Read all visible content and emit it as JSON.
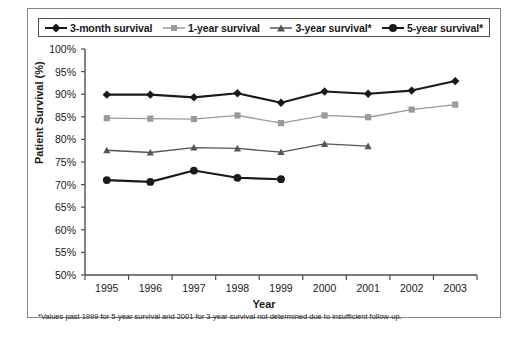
{
  "chart_data": {
    "type": "line",
    "title": "",
    "xlabel": "Year",
    "ylabel": "Patient Survival (%)",
    "categories": [
      1995,
      1996,
      1997,
      1998,
      1999,
      2000,
      2001,
      2002,
      2003
    ],
    "x_tick_labels": [
      "1995",
      "1996",
      "1997",
      "1998",
      "1999",
      "2000",
      "2001",
      "2002",
      "2003"
    ],
    "y_tick_labels": [
      "100%",
      "95%",
      "90%",
      "85%",
      "80%",
      "75%",
      "70%",
      "65%",
      "60%",
      "55%",
      "50%"
    ],
    "y_tick_values": [
      100,
      95,
      90,
      85,
      80,
      75,
      70,
      65,
      60,
      55,
      50
    ],
    "ylim": [
      50,
      100
    ],
    "y_tick_step": 5,
    "grid": false,
    "legend_position": "top",
    "series": [
      {
        "name": "3-month survival",
        "marker": "diamond",
        "color": "#1a1a1a",
        "values": [
          89.9,
          89.9,
          89.3,
          90.2,
          88.1,
          90.6,
          90.1,
          90.8,
          92.9
        ]
      },
      {
        "name": "1-year survival",
        "marker": "square",
        "color": "#9a9a9a",
        "values": [
          84.7,
          84.6,
          84.5,
          85.3,
          83.6,
          85.3,
          84.9,
          86.6,
          87.7
        ]
      },
      {
        "name": "3-year survival*",
        "marker": "triangle",
        "color": "#555555",
        "values": [
          77.6,
          77.1,
          78.2,
          78.0,
          77.2,
          79.0,
          78.5,
          null,
          null
        ]
      },
      {
        "name": "5-year survival*",
        "marker": "circle",
        "color": "#1a1a1a",
        "values": [
          71.0,
          70.6,
          73.1,
          71.5,
          71.2,
          null,
          null,
          null,
          null
        ]
      }
    ],
    "footnote": "*Values past 1999 for 5-year survival and 2001 for 3-year survival not determined due to insufficient follow-up."
  },
  "legend": {
    "items": [
      {
        "label": "3-month survival",
        "marker": "diamond",
        "color": "#1a1a1a"
      },
      {
        "label": "1-year survival",
        "marker": "square",
        "color": "#9a9a9a"
      },
      {
        "label": "3-year survival*",
        "marker": "triangle",
        "color": "#555555"
      },
      {
        "label": "5-year survival*",
        "marker": "circle",
        "color": "#1a1a1a"
      }
    ]
  },
  "colors": {
    "axis": "#4d4d4d",
    "frame": "#8a8a8a",
    "text": "#1a1a1a",
    "background": "#ffffff"
  }
}
